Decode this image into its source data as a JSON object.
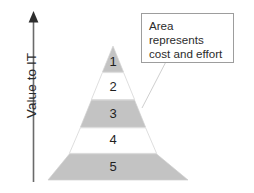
{
  "diagram": {
    "type": "pyramid",
    "axis": {
      "label": "Value to IT",
      "direction": "up",
      "arrow_icon": "arrow-up-icon",
      "color": "#555555"
    },
    "callout": {
      "lines": [
        "Area",
        "represents",
        "cost and effort"
      ],
      "text": "Area represents cost and effort",
      "border_color": "#9d9d9d",
      "background": "#ffffff",
      "leader_line": true
    },
    "levels": [
      {
        "label": "1",
        "fill": "shaded",
        "color": "#c3c3c3"
      },
      {
        "label": "2",
        "fill": "plain",
        "color": "#ffffff"
      },
      {
        "label": "3",
        "fill": "shaded",
        "color": "#c3c3c3"
      },
      {
        "label": "4",
        "fill": "plain",
        "color": "#ffffff"
      },
      {
        "label": "5",
        "fill": "shaded",
        "color": "#c3c3c3"
      }
    ],
    "outline_color": "#d9d9d9",
    "background": "#ffffff"
  }
}
